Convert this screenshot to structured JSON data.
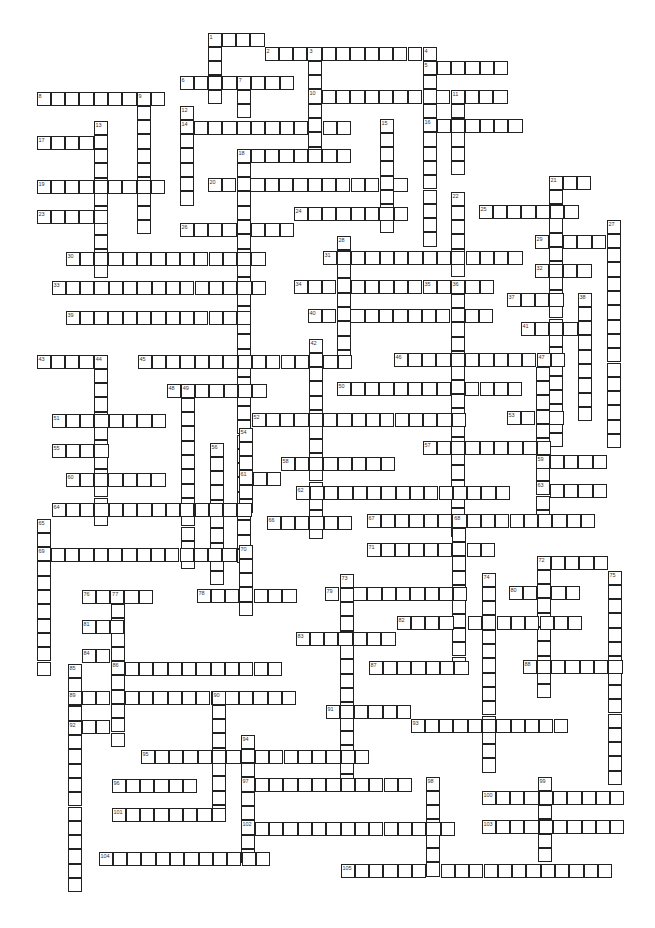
{
  "puzzle": {
    "type": "crossword",
    "cell_size": 14.3,
    "entries": [
      {
        "n": "1",
        "dir": "across",
        "x": 208,
        "y": 33,
        "len": 4
      },
      {
        "n": "1",
        "dir": "down",
        "x": 208,
        "y": 33,
        "len": 5
      },
      {
        "n": "2",
        "dir": "across",
        "x": 265,
        "y": 47,
        "len": 11
      },
      {
        "n": "3",
        "dir": "down",
        "x": 308,
        "y": 47,
        "len": 8
      },
      {
        "n": "4",
        "dir": "down",
        "x": 423,
        "y": 47,
        "len": 14
      },
      {
        "n": "5",
        "dir": "across",
        "x": 423,
        "y": 61,
        "len": 6
      },
      {
        "n": "6",
        "dir": "across",
        "x": 180,
        "y": 76,
        "len": 8
      },
      {
        "n": "7",
        "dir": "down",
        "x": 237,
        "y": 76,
        "len": 3
      },
      {
        "n": "8",
        "dir": "across",
        "x": 37,
        "y": 92,
        "len": 9
      },
      {
        "n": "9",
        "dir": "down",
        "x": 137,
        "y": 92,
        "len": 10
      },
      {
        "n": "10",
        "dir": "across",
        "x": 308,
        "y": 90,
        "len": 14
      },
      {
        "n": "11",
        "dir": "down",
        "x": 451,
        "y": 90,
        "len": 6
      },
      {
        "n": "12",
        "dir": "down",
        "x": 180,
        "y": 106,
        "len": 7
      },
      {
        "n": "13",
        "dir": "down",
        "x": 94,
        "y": 121,
        "len": 11
      },
      {
        "n": "14",
        "dir": "across",
        "x": 180,
        "y": 121,
        "len": 12
      },
      {
        "n": "15",
        "dir": "down",
        "x": 380,
        "y": 119,
        "len": 8
      },
      {
        "n": "16",
        "dir": "across",
        "x": 423,
        "y": 119,
        "len": 7
      },
      {
        "n": "17",
        "dir": "across",
        "x": 37,
        "y": 136,
        "len": 5
      },
      {
        "n": "18",
        "dir": "across",
        "x": 237,
        "y": 149,
        "len": 8
      },
      {
        "n": "18",
        "dir": "down",
        "x": 237,
        "y": 149,
        "len": 29
      },
      {
        "n": "19",
        "dir": "across",
        "x": 37,
        "y": 180,
        "len": 9
      },
      {
        "n": "20",
        "dir": "across",
        "x": 208,
        "y": 178,
        "len": 14
      },
      {
        "n": "21",
        "dir": "across",
        "x": 549,
        "y": 176,
        "len": 3
      },
      {
        "n": "21",
        "dir": "down",
        "x": 549,
        "y": 176,
        "len": 19
      },
      {
        "n": "22",
        "dir": "down",
        "x": 451,
        "y": 192,
        "len": 6
      },
      {
        "n": "23",
        "dir": "across",
        "x": 37,
        "y": 210,
        "len": 5
      },
      {
        "n": "24",
        "dir": "across",
        "x": 294,
        "y": 207,
        "len": 8
      },
      {
        "n": "25",
        "dir": "across",
        "x": 479,
        "y": 205,
        "len": 7
      },
      {
        "n": "26",
        "dir": "across",
        "x": 180,
        "y": 223,
        "len": 8
      },
      {
        "n": "27",
        "dir": "down",
        "x": 607,
        "y": 220,
        "len": 16
      },
      {
        "n": "28",
        "dir": "down",
        "x": 337,
        "y": 236,
        "len": 9
      },
      {
        "n": "29",
        "dir": "across",
        "x": 535,
        "y": 235,
        "len": 6
      },
      {
        "n": "30",
        "dir": "across",
        "x": 66,
        "y": 252,
        "len": 14
      },
      {
        "n": "31",
        "dir": "across",
        "x": 323,
        "y": 251,
        "len": 14
      },
      {
        "n": "32",
        "dir": "across",
        "x": 535,
        "y": 264,
        "len": 4
      },
      {
        "n": "33",
        "dir": "across",
        "x": 52,
        "y": 281,
        "len": 15
      },
      {
        "n": "34",
        "dir": "across",
        "x": 294,
        "y": 280,
        "len": 9
      },
      {
        "n": "35",
        "dir": "across",
        "x": 423,
        "y": 280,
        "len": 5
      },
      {
        "n": "36",
        "dir": "down",
        "x": 451,
        "y": 280,
        "len": 18
      },
      {
        "n": "37",
        "dir": "across",
        "x": 507,
        "y": 293,
        "len": 4
      },
      {
        "n": "38",
        "dir": "down",
        "x": 578,
        "y": 293,
        "len": 9
      },
      {
        "n": "39",
        "dir": "across",
        "x": 66,
        "y": 311,
        "len": 13
      },
      {
        "n": "40",
        "dir": "across",
        "x": 308,
        "y": 309,
        "len": 13
      },
      {
        "n": "41",
        "dir": "across",
        "x": 521,
        "y": 322,
        "len": 5
      },
      {
        "n": "42",
        "dir": "down",
        "x": 309,
        "y": 339,
        "len": 14
      },
      {
        "n": "43",
        "dir": "across",
        "x": 37,
        "y": 355,
        "len": 5
      },
      {
        "n": "44",
        "dir": "down",
        "x": 94,
        "y": 355,
        "len": 12
      },
      {
        "n": "45",
        "dir": "across",
        "x": 138,
        "y": 355,
        "len": 15
      },
      {
        "n": "46",
        "dir": "across",
        "x": 394,
        "y": 353,
        "len": 12
      },
      {
        "n": "47",
        "dir": "down",
        "x": 536,
        "y": 353,
        "len": 12
      },
      {
        "n": "48",
        "dir": "across",
        "x": 167,
        "y": 384,
        "len": 7
      },
      {
        "n": "49",
        "dir": "down",
        "x": 181,
        "y": 384,
        "len": 13
      },
      {
        "n": "50",
        "dir": "across",
        "x": 337,
        "y": 382,
        "len": 13
      },
      {
        "n": "51",
        "dir": "across",
        "x": 52,
        "y": 414,
        "len": 8
      },
      {
        "n": "52",
        "dir": "across",
        "x": 252,
        "y": 413,
        "len": 15
      },
      {
        "n": "53",
        "dir": "across",
        "x": 507,
        "y": 411,
        "len": 4
      },
      {
        "n": "54",
        "dir": "down",
        "x": 239,
        "y": 428,
        "len": 6
      },
      {
        "n": "55",
        "dir": "across",
        "x": 52,
        "y": 444,
        "len": 4
      },
      {
        "n": "56",
        "dir": "down",
        "x": 210,
        "y": 443,
        "len": 10
      },
      {
        "n": "57",
        "dir": "across",
        "x": 423,
        "y": 441,
        "len": 9
      },
      {
        "n": "58",
        "dir": "across",
        "x": 281,
        "y": 457,
        "len": 8
      },
      {
        "n": "59",
        "dir": "across",
        "x": 536,
        "y": 455,
        "len": 5
      },
      {
        "n": "60",
        "dir": "across",
        "x": 66,
        "y": 473,
        "len": 7
      },
      {
        "n": "61",
        "dir": "across",
        "x": 239,
        "y": 472,
        "len": 3
      },
      {
        "n": "62",
        "dir": "across",
        "x": 296,
        "y": 486,
        "len": 15
      },
      {
        "n": "63",
        "dir": "across",
        "x": 536,
        "y": 484,
        "len": 5
      },
      {
        "n": "64",
        "dir": "across",
        "x": 52,
        "y": 503,
        "len": 14
      },
      {
        "n": "65",
        "dir": "down",
        "x": 37,
        "y": 519,
        "len": 11
      },
      {
        "n": "66",
        "dir": "across",
        "x": 267,
        "y": 516,
        "len": 6
      },
      {
        "n": "67",
        "dir": "across",
        "x": 367,
        "y": 514,
        "len": 16
      },
      {
        "n": "68",
        "dir": "down",
        "x": 452,
        "y": 514,
        "len": 11
      },
      {
        "n": "69",
        "dir": "across",
        "x": 37,
        "y": 548,
        "len": 15
      },
      {
        "n": "70",
        "dir": "down",
        "x": 239,
        "y": 545,
        "len": 5
      },
      {
        "n": "71",
        "dir": "across",
        "x": 367,
        "y": 543,
        "len": 9
      },
      {
        "n": "72",
        "dir": "across",
        "x": 537,
        "y": 556,
        "len": 5
      },
      {
        "n": "72",
        "dir": "down",
        "x": 537,
        "y": 556,
        "len": 10
      },
      {
        "n": "73",
        "dir": "down",
        "x": 340,
        "y": 574,
        "len": 15
      },
      {
        "n": "74",
        "dir": "down",
        "x": 482,
        "y": 573,
        "len": 14
      },
      {
        "n": "75",
        "dir": "down",
        "x": 608,
        "y": 571,
        "len": 15
      },
      {
        "n": "76",
        "dir": "across",
        "x": 82,
        "y": 590,
        "len": 5
      },
      {
        "n": "77",
        "dir": "down",
        "x": 111,
        "y": 590,
        "len": 11
      },
      {
        "n": "78",
        "dir": "across",
        "x": 197,
        "y": 589,
        "len": 7
      },
      {
        "n": "79",
        "dir": "across",
        "x": 325,
        "y": 587,
        "len": 10
      },
      {
        "n": "80",
        "dir": "across",
        "x": 509,
        "y": 586,
        "len": 5
      },
      {
        "n": "81",
        "dir": "across",
        "x": 82,
        "y": 620,
        "len": 3
      },
      {
        "n": "82",
        "dir": "across",
        "x": 397,
        "y": 616,
        "len": 13
      },
      {
        "n": "83",
        "dir": "across",
        "x": 296,
        "y": 632,
        "len": 7
      },
      {
        "n": "84",
        "dir": "across",
        "x": 82,
        "y": 649,
        "len": 3
      },
      {
        "n": "85",
        "dir": "down",
        "x": 68,
        "y": 664,
        "len": 16
      },
      {
        "n": "86",
        "dir": "across",
        "x": 111,
        "y": 662,
        "len": 12
      },
      {
        "n": "87",
        "dir": "across",
        "x": 369,
        "y": 661,
        "len": 7
      },
      {
        "n": "88",
        "dir": "across",
        "x": 523,
        "y": 660,
        "len": 7
      },
      {
        "n": "89",
        "dir": "across",
        "x": 68,
        "y": 691,
        "len": 16
      },
      {
        "n": "90",
        "dir": "down",
        "x": 212,
        "y": 691,
        "len": 9
      },
      {
        "n": "91",
        "dir": "across",
        "x": 326,
        "y": 705,
        "len": 6
      },
      {
        "n": "92",
        "dir": "across",
        "x": 68,
        "y": 720,
        "len": 4
      },
      {
        "n": "93",
        "dir": "across",
        "x": 411,
        "y": 719,
        "len": 11
      },
      {
        "n": "94",
        "dir": "down",
        "x": 241,
        "y": 735,
        "len": 9
      },
      {
        "n": "95",
        "dir": "across",
        "x": 141,
        "y": 750,
        "len": 16
      },
      {
        "n": "96",
        "dir": "across",
        "x": 112,
        "y": 779,
        "len": 6
      },
      {
        "n": "97",
        "dir": "across",
        "x": 241,
        "y": 778,
        "len": 12
      },
      {
        "n": "98",
        "dir": "down",
        "x": 426,
        "y": 777,
        "len": 7
      },
      {
        "n": "99",
        "dir": "down",
        "x": 538,
        "y": 777,
        "len": 6
      },
      {
        "n": "100",
        "dir": "across",
        "x": 482,
        "y": 791,
        "len": 10
      },
      {
        "n": "101",
        "dir": "across",
        "x": 112,
        "y": 808,
        "len": 8
      },
      {
        "n": "102",
        "dir": "across",
        "x": 241,
        "y": 822,
        "len": 15
      },
      {
        "n": "103",
        "dir": "across",
        "x": 482,
        "y": 820,
        "len": 10
      },
      {
        "n": "104",
        "dir": "across",
        "x": 99,
        "y": 852,
        "len": 12
      },
      {
        "n": "105",
        "dir": "across",
        "x": 341,
        "y": 864,
        "len": 19
      }
    ]
  }
}
